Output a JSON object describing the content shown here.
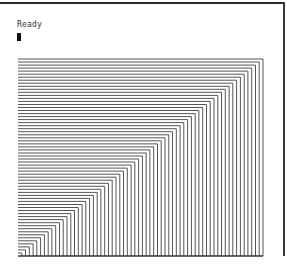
{
  "terminal": {
    "status": "Ready",
    "cursor": "block"
  },
  "graphic": {
    "description": "nested L-shaped staircase lines",
    "line_count": 65,
    "left_x": 18,
    "right_x": 263,
    "top_y": 59,
    "bottom_y": 256,
    "line_color": "#555555",
    "baseline_color": "#333333"
  },
  "colors": {
    "background": "#ffffff",
    "frame": "#2a2a2a",
    "text": "#333333",
    "cursor": "#111111"
  }
}
